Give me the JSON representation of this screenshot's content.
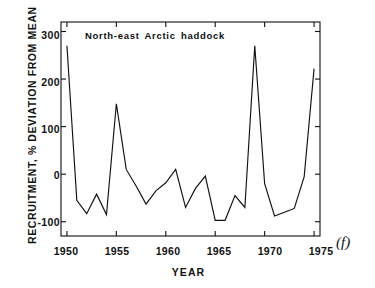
{
  "figure": {
    "panel_label": "(f)",
    "annotation": "North-east Arctic haddock",
    "axis_color": "#111111",
    "line_color": "#111111",
    "background": "#ffffff"
  },
  "chart_data": {
    "type": "line",
    "title": "North-east Arctic haddock",
    "xlabel": "YEAR",
    "ylabel": "RECRUITMENT, % DEVIATION FROM MEAN",
    "xlim": [
      1949.4,
      1975.6
    ],
    "ylim": [
      -130,
      320
    ],
    "grid": false,
    "legend": null,
    "xticks": [
      1950,
      1955,
      1960,
      1965,
      1970,
      1975
    ],
    "xtick_labels": [
      "1950",
      "1955",
      "1960",
      "1965",
      "1970",
      "1975"
    ],
    "yticks": [
      -100,
      0,
      100,
      200,
      300
    ],
    "ytick_labels": [
      "-100",
      "0",
      "100",
      "200",
      "300"
    ],
    "x": [
      1950,
      1951,
      1952,
      1953,
      1954,
      1955,
      1956,
      1957,
      1958,
      1959,
      1960,
      1961,
      1962,
      1963,
      1964,
      1965,
      1966,
      1967,
      1968,
      1969,
      1970,
      1971,
      1972,
      1973,
      1974,
      1975
    ],
    "values": [
      270,
      -55,
      -83,
      -42,
      -85,
      148,
      10,
      -25,
      -63,
      -35,
      -18,
      10,
      -70,
      -30,
      -4,
      -97,
      -97,
      -45,
      -70,
      270,
      -20,
      -88,
      -80,
      -72,
      -5,
      222
    ],
    "series": [
      {
        "name": "North-east Arctic haddock recruitment",
        "values": [
          270,
          -55,
          -83,
          -42,
          -85,
          148,
          10,
          -25,
          -63,
          -35,
          -18,
          10,
          -70,
          -30,
          -4,
          -97,
          -97,
          -45,
          -70,
          270,
          -20,
          -88,
          -80,
          -72,
          -5,
          222
        ]
      }
    ]
  }
}
